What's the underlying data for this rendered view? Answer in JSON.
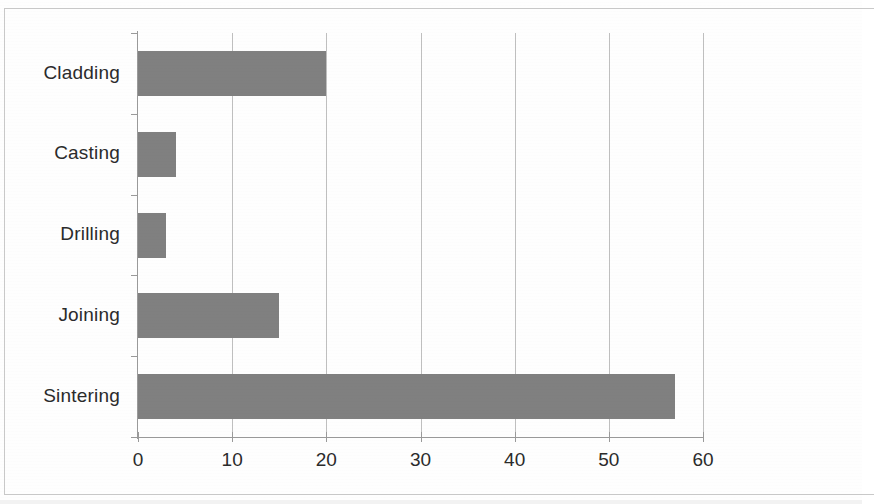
{
  "chart_data": {
    "type": "bar",
    "orientation": "horizontal",
    "title": "",
    "subtitle": "",
    "xlabel": "",
    "ylabel": "",
    "categories": [
      "Cladding",
      "Casting",
      "Drilling",
      "Joining",
      "Sintering"
    ],
    "values": [
      20,
      4,
      3,
      15,
      57
    ],
    "series": [
      {
        "name": "",
        "values": [
          20,
          4,
          3,
          15,
          57
        ]
      }
    ],
    "xlim": [
      0,
      60
    ],
    "ylim": [
      0,
      5
    ],
    "xticks": [
      0,
      10,
      20,
      30,
      40,
      50,
      60
    ],
    "xtick_labels": [
      "0",
      "10",
      "20",
      "30",
      "40",
      "50",
      "60"
    ],
    "ytick_labels": [
      "Cladding",
      "Casting",
      "Drilling",
      "Joining",
      "Sintering"
    ],
    "grid": {
      "vertical": true,
      "horizontal": false,
      "at": [
        10,
        20,
        30,
        40,
        50,
        60
      ]
    },
    "legend": {
      "visible": false,
      "position": "none",
      "entries": []
    },
    "annotations": [],
    "data_labels": {
      "visible": false
    },
    "colors": {
      "bar_fill": "#808080",
      "gridline": "#bfbfbf",
      "axis_line": "#9a9a9a",
      "text": "#2b2b2b",
      "background": "#fefefe",
      "page_border": "#c9c9c9"
    }
  }
}
